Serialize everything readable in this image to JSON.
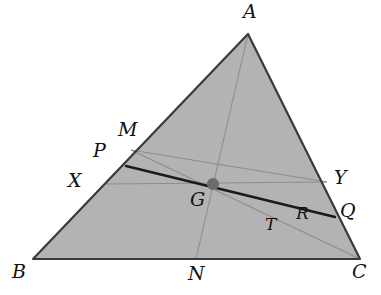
{
  "figure": {
    "kind": "euclidean-geometry-diagram",
    "background_color": "#ffffff",
    "fill_color": "#b3b3b3",
    "outline_color": "#3a3a3a",
    "thin_line_color": "#8d8d8d",
    "thick_line_color": "#1a1a1a",
    "point_color": "#6b6b6b",
    "label_color": "#111111"
  },
  "labels": {
    "A": "A",
    "B": "B",
    "C": "C",
    "M": "M",
    "N": "N",
    "P": "P",
    "Q": "Q",
    "R": "R",
    "T": "T",
    "X": "X",
    "Y": "Y",
    "G": "G"
  },
  "label_positions": {
    "A": {
      "x": 243,
      "y": 2
    },
    "B": {
      "x": 12,
      "y": 262
    },
    "C": {
      "x": 352,
      "y": 262
    },
    "M": {
      "x": 118,
      "y": 120
    },
    "N": {
      "x": 188,
      "y": 264
    },
    "P": {
      "x": 93,
      "y": 141
    },
    "Q": {
      "x": 340,
      "y": 201
    },
    "R": {
      "x": 296,
      "y": 205
    },
    "T": {
      "x": 265,
      "y": 216
    },
    "X": {
      "x": 68,
      "y": 171
    },
    "Y": {
      "x": 334,
      "y": 168
    },
    "G": {
      "x": 190,
      "y": 190
    }
  },
  "points": {
    "A": {
      "x": 248,
      "y": 34
    },
    "B": {
      "x": 33,
      "y": 259
    },
    "C": {
      "x": 360,
      "y": 259
    },
    "G": {
      "x": 213,
      "y": 184
    },
    "M": {
      "x": 131,
      "y": 150
    },
    "N": {
      "x": 196,
      "y": 259
    },
    "P": {
      "x": 126,
      "y": 166
    },
    "Q": {
      "x": 335,
      "y": 217
    },
    "R": {
      "x": 306,
      "y": 198
    },
    "T": {
      "x": 285,
      "y": 212
    },
    "X": {
      "x": 106,
      "y": 184
    },
    "Y": {
      "x": 327,
      "y": 182
    }
  },
  "segments": [
    {
      "name": "side-AB",
      "from": "A",
      "to": "B",
      "style": "outline"
    },
    {
      "name": "side-BC",
      "from": "B",
      "to": "C",
      "style": "outline"
    },
    {
      "name": "side-CA",
      "from": "C",
      "to": "A",
      "style": "outline"
    },
    {
      "name": "median-AN",
      "from": "A",
      "to": "N",
      "style": "thin"
    },
    {
      "name": "cevian-MC",
      "from": "M",
      "to": "C",
      "style": "thin"
    },
    {
      "name": "line-XY",
      "from": "X",
      "to": "Y",
      "style": "thin"
    },
    {
      "name": "line-MY",
      "from": "M",
      "to": "Y",
      "style": "thin"
    },
    {
      "name": "line-PQ",
      "from": "P",
      "to": "Q",
      "style": "thick"
    }
  ],
  "marked_point": {
    "name": "G",
    "radius": 6
  }
}
